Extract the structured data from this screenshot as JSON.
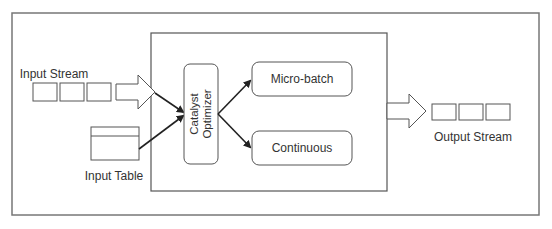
{
  "diagram": {
    "type": "flow",
    "nodes": {
      "input_stream": {
        "label": "Input Stream",
        "cells": 3
      },
      "input_table": {
        "label": "Input Table"
      },
      "catalyst_optimizer": {
        "label_line1": "Catalyst",
        "label_line2": "Optimizer"
      },
      "micro_batch": {
        "label": "Micro-batch"
      },
      "continuous": {
        "label": "Continuous"
      },
      "output_stream": {
        "label": "Output Stream",
        "cells": 3
      }
    },
    "edges": [
      {
        "from": "input_stream",
        "to": "catalyst_optimizer"
      },
      {
        "from": "input_table",
        "to": "catalyst_optimizer"
      },
      {
        "from": "catalyst_optimizer",
        "to": "micro_batch"
      },
      {
        "from": "catalyst_optimizer",
        "to": "continuous"
      },
      {
        "from": "engine",
        "to": "output_stream"
      }
    ],
    "colors": {
      "stroke": "#555555",
      "arrow": "#222222",
      "text": "#333333"
    }
  }
}
